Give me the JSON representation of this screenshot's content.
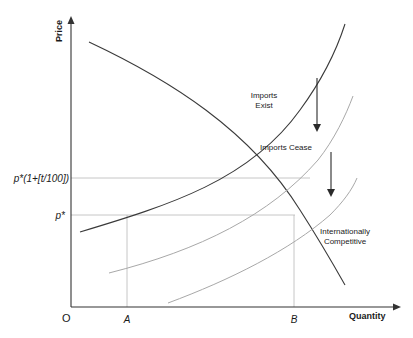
{
  "diagram": {
    "axes": {
      "y_label": "Price",
      "x_label": "Quantity",
      "origin_label": "O"
    },
    "y_ticks": {
      "upper": "p*(1+[t/100])",
      "lower": "p*"
    },
    "x_ticks": {
      "a": "A",
      "b": "B"
    },
    "curves": {
      "demand": "Demand",
      "supply_imports_exist_line1": "Imports",
      "supply_imports_exist_line2": "Exist",
      "supply_imports_cease": "Imports Cease",
      "supply_intl_competitive_line1": "Internationally",
      "supply_intl_competitive_line2": "Competitive"
    },
    "colors": {
      "axis": "#333333",
      "demand": "#3a3a3a",
      "supply_imports_exist": "#3a3a3a",
      "supply_shifted": "#a8a8a8",
      "guide_lines": "#b0b0b0",
      "arrows": "#2a2a2a"
    }
  }
}
